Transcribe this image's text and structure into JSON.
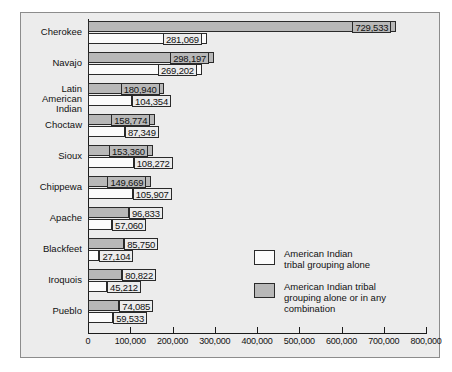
{
  "chart_data": {
    "type": "bar",
    "orientation": "horizontal",
    "title": "",
    "xlabel": "",
    "ylabel": "",
    "xlim": [
      0,
      800000
    ],
    "grid": false,
    "legend_position": "lower-right",
    "categories": [
      "Cherokee",
      "Navajo",
      "Latin American\nIndian",
      "Choctaw",
      "Sioux",
      "Chippewa",
      "Apache",
      "Blackfeet",
      "Iroquois",
      "Pueblo"
    ],
    "series": [
      {
        "name": "American Indian tribal\ngrouping alone or in any combination",
        "key": "combo",
        "values": [
          729533,
          298197,
          180940,
          158774,
          153360,
          149669,
          96833,
          85750,
          80822,
          74085
        ],
        "labels": [
          "729,533",
          "298,197",
          "180,940",
          "158,774",
          "153,360",
          "149,669",
          "96,833",
          "85,750",
          "80,822",
          "74,085"
        ]
      },
      {
        "name": "American Indian\ntribal grouping alone",
        "key": "alone",
        "values": [
          281069,
          269202,
          104354,
          87349,
          108272,
          105907,
          57060,
          27104,
          45212,
          59533
        ],
        "labels": [
          "281,069",
          "269,202",
          "104,354",
          "87,349",
          "108,272",
          "105,907",
          "57,060",
          "27,104",
          "45,212",
          "59,533"
        ]
      }
    ],
    "xticks": [
      0,
      100000,
      200000,
      300000,
      400000,
      500000,
      600000,
      700000,
      800000
    ],
    "xtick_labels": [
      "0",
      "100,000",
      "200,000",
      "300,000",
      "400,000",
      "500,000",
      "600,000",
      "700,000",
      "800,000"
    ]
  },
  "legend": {
    "items": [
      {
        "label": "American Indian\ntribal grouping alone",
        "swatch": "alone",
        "color": "#fbfbfb"
      },
      {
        "label": "American Indian tribal\ngrouping alone or in any combination",
        "swatch": "combo",
        "color": "#b8b8b8"
      }
    ]
  },
  "colors": {
    "background": "#ececec",
    "border": "#8c8c8c",
    "axis": "#1b1b1b",
    "bar_combo": "#b8b8b8",
    "bar_alone": "#fbfbfb",
    "text": "#111111"
  }
}
